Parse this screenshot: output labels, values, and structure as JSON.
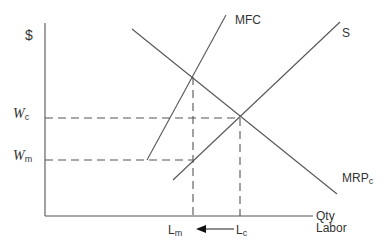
{
  "diagram": {
    "axes": {
      "y_label": "$",
      "x_label_line1": "Qty",
      "x_label_line2": "Labor"
    },
    "curves": {
      "mfc": "MFC",
      "supply": "S",
      "mrp": "MRP",
      "mrp_sub": "c"
    },
    "wages": {
      "wc_main": "W",
      "wc_sub": "c",
      "wm_main": "W",
      "wm_sub": "m"
    },
    "quantities": {
      "lm_main": "L",
      "lm_sub": "m",
      "lc_main": "L",
      "lc_sub": "c"
    },
    "line_color": "#555555"
  }
}
